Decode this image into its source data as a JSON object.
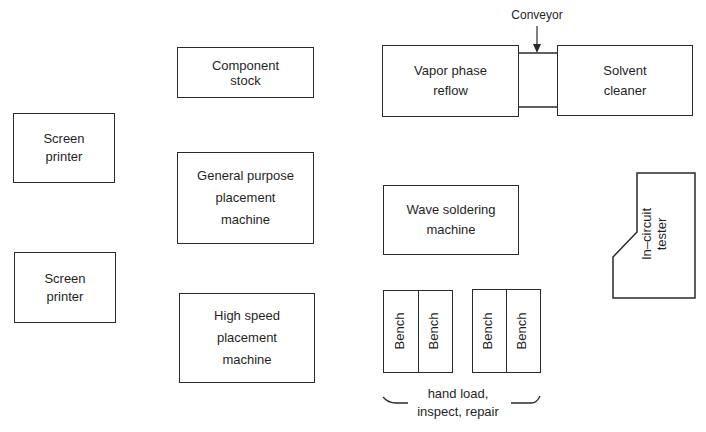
{
  "diagram": {
    "stations": [
      {
        "id": "screen-printer-1",
        "label": "Screen\nprinter"
      },
      {
        "id": "screen-printer-2",
        "label": "Screen\nprinter"
      },
      {
        "id": "component-stock",
        "label": "Component\nstock"
      },
      {
        "id": "general-purpose-placement",
        "label": "General purpose\nplacement\nmachine"
      },
      {
        "id": "high-speed-placement",
        "label": "High speed\nplacement\nmachine"
      },
      {
        "id": "vapor-phase-reflow",
        "label": "Vapor phase\nreflow"
      },
      {
        "id": "solvent-cleaner",
        "label": "Solvent\ncleaner"
      },
      {
        "id": "wave-soldering",
        "label": "Wave soldering\nmachine"
      },
      {
        "id": "in-circuit-tester",
        "label": "In–circuit\ntester"
      }
    ],
    "conveyor": {
      "label": "Conveyor"
    },
    "benches": [
      {
        "label": "Bench"
      },
      {
        "label": "Bench"
      },
      {
        "label": "Bench"
      },
      {
        "label": "Bench"
      }
    ],
    "bench_group_label": "hand load,\ninspect, repair",
    "colors": {
      "stroke": "#2a2a2a",
      "background": "#ffffff",
      "text": "#1f1f1f"
    }
  }
}
